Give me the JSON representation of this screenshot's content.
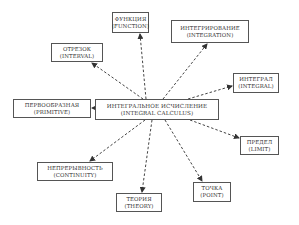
{
  "diagram": {
    "type": "concept-map",
    "center": {
      "ru": "ИНТЕГРАЛЬНОЕ ИСЧИСЛЕНИЕ",
      "en": "(INTEGRAL CALCULUS)"
    },
    "nodes": [
      {
        "id": "function",
        "ru": "ФУНКЦИЯ",
        "en": "(FUNCTION)"
      },
      {
        "id": "integration",
        "ru": "ИНТЕГРИРОВАНИЕ",
        "en": "(INTEGRATION)"
      },
      {
        "id": "interval",
        "ru": "ОТРЕЗОК",
        "en": "(INTERVAL)"
      },
      {
        "id": "integral",
        "ru": "ИНТЕГРАЛ",
        "en": "(INTEGRAL)"
      },
      {
        "id": "primitive",
        "ru": "ПЕРВООБРАЗНАЯ",
        "en": "(PRIMITIVE)"
      },
      {
        "id": "limit",
        "ru": "ПРЕДЕЛ",
        "en": "(LIMIT)"
      },
      {
        "id": "continuity",
        "ru": "НЕПРЕРЫВНОСТЬ",
        "en": "(CONTINUITY)"
      },
      {
        "id": "point",
        "ru": "ТОЧКА",
        "en": "(POINT)"
      },
      {
        "id": "theory",
        "ru": "ТЕОРИЯ",
        "en": "(THEORY)"
      }
    ],
    "edges": [
      {
        "from": "center",
        "to": "function",
        "style": "dashed-arrow"
      },
      {
        "from": "center",
        "to": "integration",
        "style": "dashed-arrow"
      },
      {
        "from": "center",
        "to": "interval",
        "style": "dashed-arrow"
      },
      {
        "from": "center",
        "to": "integral",
        "style": "dashed-arrow"
      },
      {
        "from": "center",
        "to": "primitive",
        "style": "dashed-arrow"
      },
      {
        "from": "center",
        "to": "limit",
        "style": "dashed-arrow"
      },
      {
        "from": "center",
        "to": "continuity",
        "style": "dashed-arrow"
      },
      {
        "from": "center",
        "to": "point",
        "style": "dashed-arrow"
      },
      {
        "from": "center",
        "to": "theory",
        "style": "dashed-arrow"
      }
    ],
    "colors": {
      "line": "#444444",
      "box_border": "#555555",
      "text": "#333333",
      "background": "#ffffff"
    }
  }
}
